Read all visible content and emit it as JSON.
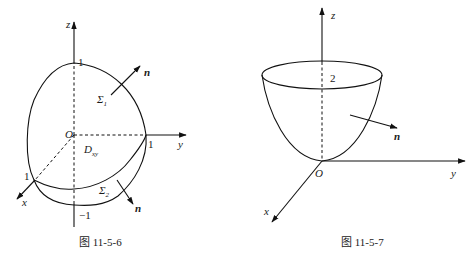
{
  "figures": [
    {
      "id": "fig-11-5-6",
      "caption": "图 11-5-6",
      "axes": {
        "x": "x",
        "y": "y",
        "z": "z"
      },
      "origin": "O",
      "ticks": {
        "z_top": "1",
        "z_bottom": "−1",
        "y": "1",
        "x": "1"
      },
      "surfaces": {
        "upper": "Σ",
        "upper_sub": "1",
        "lower": "Σ",
        "lower_sub": "2"
      },
      "region": {
        "main": "D",
        "sub": "xy"
      },
      "normal_label": "n"
    },
    {
      "id": "fig-11-5-7",
      "caption": "图 11-5-7",
      "axes": {
        "x": "x",
        "y": "y",
        "z": "z"
      },
      "origin": "O",
      "ticks": {
        "z": "2"
      },
      "normal_label": "n"
    }
  ]
}
